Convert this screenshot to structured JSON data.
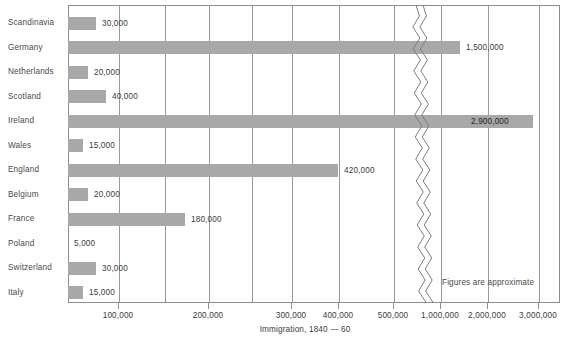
{
  "chart_data": {
    "type": "bar",
    "orientation": "horizontal",
    "title": "",
    "xlabel": "Immigration, 1840 — 60",
    "ylabel": "",
    "categories": [
      "Scandinavia",
      "Germany",
      "Netherlands",
      "Scotland",
      "Ireland",
      "Wales",
      "England",
      "Belgium",
      "France",
      "Poland",
      "Switzerland",
      "Italy"
    ],
    "values": [
      30000,
      1500000,
      20000,
      40000,
      2900000,
      15000,
      420000,
      20000,
      180000,
      5000,
      30000,
      15000
    ],
    "value_labels": [
      "30,000",
      "1,500,000",
      "20,000",
      "40,000",
      "2,900,000",
      "15,000",
      "420,000",
      "20,000",
      "180,000",
      "5,000",
      "30,000",
      "15,000"
    ],
    "xlim": [
      0,
      3000000
    ],
    "axis_break": {
      "present": true,
      "between": [
        500000,
        1000000
      ],
      "style": "double-wavy"
    },
    "grid": true,
    "legend": null,
    "annotations": [
      "Figures are approximate"
    ],
    "tick_labels_left": [
      "100,000",
      "200,000",
      "300,000",
      "400,000",
      "500,000"
    ],
    "tick_labels_right": [
      "1,000,000",
      "2,000,000",
      "3,000,000"
    ],
    "bar_color": "#a8a8a8",
    "axis_color": "#8d8d8d"
  },
  "annotation": {
    "figures_note": "Figures are approximate"
  },
  "axis": {
    "title": "Immigration, 1840 — 60",
    "ticks": [
      {
        "label": "100,000",
        "x": 118
      },
      {
        "label": "200,000",
        "x": 208
      },
      {
        "label": "300,000",
        "x": 291
      },
      {
        "label": "400,000",
        "x": 338
      },
      {
        "label": "500,000",
        "x": 393
      },
      {
        "label": "1,000,000",
        "x": 440
      },
      {
        "label": "2,000,000",
        "x": 487
      },
      {
        "label": "3,000,000",
        "x": 538
      }
    ]
  },
  "rows": [
    {
      "label": "Scandinavia",
      "value_label": "30,000",
      "bar_width": 28,
      "label_inside": false
    },
    {
      "label": "Germany",
      "value_label": "1,500,000",
      "bar_width": 392,
      "label_inside": false
    },
    {
      "label": "Netherlands",
      "value_label": "20,000",
      "bar_width": 20,
      "label_inside": false
    },
    {
      "label": "Scotland",
      "value_label": "40,000",
      "bar_width": 38,
      "label_inside": false
    },
    {
      "label": "Ireland",
      "value_label": "2,900,000",
      "bar_width": 465,
      "label_inside": true
    },
    {
      "label": "Wales",
      "value_label": "15,000",
      "bar_width": 15,
      "label_inside": false
    },
    {
      "label": "England",
      "value_label": "420,000",
      "bar_width": 270,
      "label_inside": false
    },
    {
      "label": "Belgium",
      "value_label": "20,000",
      "bar_width": 20,
      "label_inside": false
    },
    {
      "label": "France",
      "value_label": "180,000",
      "bar_width": 117,
      "label_inside": false
    },
    {
      "label": "Poland",
      "value_label": "5,000",
      "bar_width": 0,
      "label_inside": false
    },
    {
      "label": "Switzerland",
      "value_label": "30,000",
      "bar_width": 28,
      "label_inside": false
    },
    {
      "label": "Italy",
      "value_label": "15,000",
      "bar_width": 15,
      "label_inside": false
    }
  ],
  "gridlines_x": [
    118,
    164,
    208,
    251,
    291,
    338,
    393,
    440,
    487,
    538
  ],
  "plot": {
    "left": 68,
    "top": 5,
    "width": 492,
    "height": 298,
    "row_height": 24.5,
    "first_row_center": 18
  }
}
